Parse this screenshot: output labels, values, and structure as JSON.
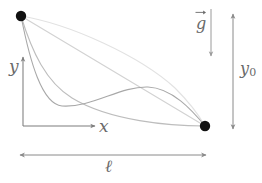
{
  "figure": {
    "background_color": "#ffffff",
    "width": 262,
    "height": 183
  },
  "labels": {
    "y_axis": "y",
    "x_axis": "x",
    "length": "ℓ",
    "height": "y",
    "height_subscript": "0",
    "gravity": "g"
  },
  "colors": {
    "dot": "#111111",
    "axis": "#7d7d7d",
    "dimension": "#8a8a8a",
    "curve_lightest": "#e2e2e2",
    "curve_light": "#d2d2d2",
    "curve_mid": "#bdbdbd",
    "curve_dark": "#a8a8a8",
    "label_text": "#6a6a6a"
  },
  "points": {
    "start": {
      "name": "upper-left-endpoint",
      "x": 21,
      "y": 16,
      "radius": 5.2
    },
    "end": {
      "name": "lower-right-endpoint",
      "x": 205,
      "y": 126,
      "radius": 5.2
    }
  },
  "axes": {
    "origin": {
      "x": 23,
      "y": 126
    },
    "y_axis": {
      "x": 23,
      "y_top": 57,
      "y_bottom": 126
    },
    "x_axis": {
      "y": 126,
      "x_left": 23,
      "x_right": 95
    }
  },
  "dimensions": {
    "length_line": {
      "y": 155,
      "x_start": 20,
      "x_end": 206
    },
    "height_line": {
      "x": 233,
      "y_start": 14,
      "y_end": 129
    },
    "gravity_arrow": {
      "x": 211,
      "y_start": 9,
      "y_end": 56
    }
  },
  "chart_data": {
    "type": "line",
    "xlabel": "x",
    "ylabel": "y",
    "grid": false,
    "legend": "none",
    "xlim": [
      21,
      205
    ],
    "ylim": [
      16,
      126
    ],
    "annotations": [
      "g",
      "y0",
      "l"
    ],
    "series": [
      {
        "name": "upper-arc",
        "color": "#e2e2e2",
        "path": "M21,16 C70,24 140,56 175,88 C190,103 200,117 205,126"
      },
      {
        "name": "straight-chord",
        "color": "#d2d2d2",
        "path": "M21,16 L205,126"
      },
      {
        "name": "cycloid",
        "color": "#bdbdbd",
        "path": "M21,16 C32,52 46,82 72,98 C110,121 170,126 205,126"
      },
      {
        "name": "dip-and-rise-curve",
        "color": "#a8a8a8",
        "path": "M21,16 C30,62 42,104 62,106 C92,108 120,86 148,87 C172,88 192,110 205,126"
      }
    ]
  }
}
